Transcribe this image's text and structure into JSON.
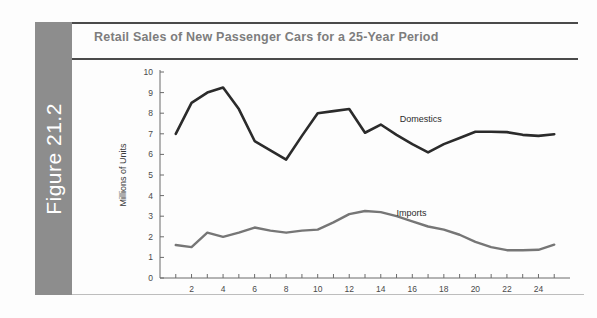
{
  "figure": {
    "tab_label": "Figure 21.2",
    "tab_color": "#8d8d8d",
    "title": "Retail Sales of New Passenger Cars for a 25-Year Period",
    "title_color": "#7d7d7d",
    "rule_color": "#4a4a4a",
    "background": "#fdfdfd"
  },
  "chart_data": {
    "type": "line",
    "title": "Retail Sales of New Passenger Cars for a 25-Year Period",
    "xlabel": "",
    "ylabel": "Millions of Units",
    "xlim": [
      0,
      26
    ],
    "ylim": [
      0,
      10
    ],
    "grid": false,
    "legend": "inline-annotation",
    "x_tick_labels": [
      "2",
      "4",
      "6",
      "8",
      "10",
      "12",
      "14",
      "16",
      "18",
      "20",
      "22",
      "24"
    ],
    "x_tick_values": [
      2,
      4,
      6,
      8,
      10,
      12,
      14,
      16,
      18,
      20,
      22,
      24
    ],
    "x_minor_ticks": [
      1,
      3,
      5,
      7,
      9,
      11,
      13,
      15,
      17,
      19,
      21,
      23,
      25
    ],
    "y_tick_labels": [
      "0",
      "1",
      "2",
      "3",
      "4",
      "5",
      "6",
      "7",
      "8",
      "9",
      "10"
    ],
    "y_tick_values": [
      0,
      1,
      2,
      3,
      4,
      5,
      6,
      7,
      8,
      9,
      10
    ],
    "x": [
      1,
      2,
      3,
      4,
      5,
      6,
      7,
      8,
      9,
      10,
      11,
      12,
      13,
      14,
      15,
      16,
      17,
      18,
      19,
      20,
      21,
      22,
      23,
      24,
      25
    ],
    "series": [
      {
        "name": "Domestics",
        "color": "#2b2b2b",
        "width": 2.6,
        "label_x": 15.2,
        "label_y": 7.55,
        "values": [
          7.0,
          8.5,
          9.0,
          9.25,
          8.2,
          6.65,
          6.2,
          5.75,
          6.9,
          8.0,
          8.1,
          8.2,
          7.05,
          7.45,
          6.95,
          6.5,
          6.1,
          6.5,
          6.8,
          7.1,
          7.1,
          7.08,
          6.95,
          6.9,
          6.98
        ]
      },
      {
        "name": "Imports",
        "color": "#767676",
        "width": 2.4,
        "label_x": 15.0,
        "label_y": 3.0,
        "values": [
          1.6,
          1.5,
          2.2,
          2.0,
          2.2,
          2.45,
          2.3,
          2.2,
          2.3,
          2.35,
          2.7,
          3.1,
          3.25,
          3.2,
          3.0,
          2.75,
          2.5,
          2.35,
          2.1,
          1.75,
          1.5,
          1.35,
          1.35,
          1.37,
          1.62
        ]
      }
    ]
  }
}
